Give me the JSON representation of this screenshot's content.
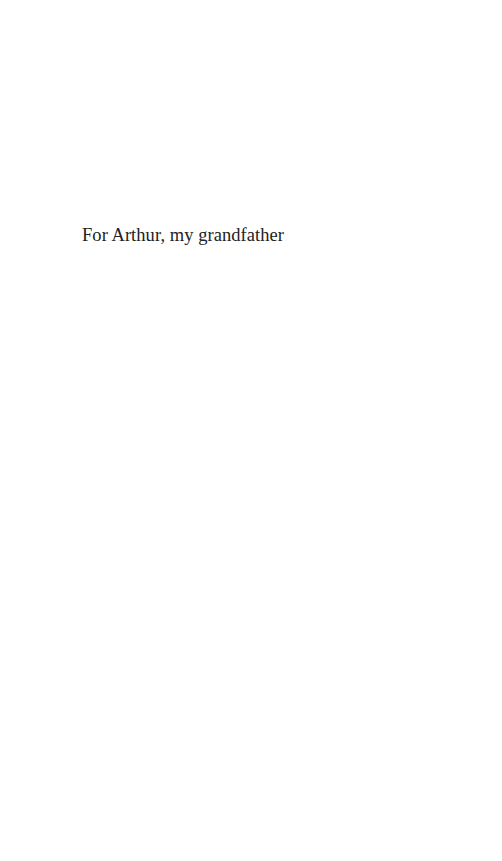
{
  "page": {
    "background_color": "#ffffff",
    "text_color": "#222222"
  },
  "dedication": {
    "text": "For Arthur, my grandfather"
  }
}
